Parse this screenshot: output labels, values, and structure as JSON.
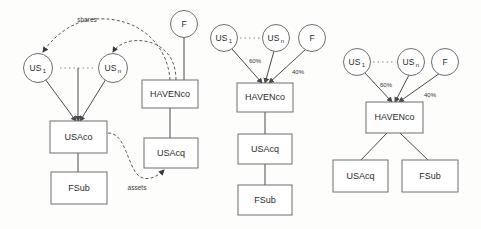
{
  "diagram": {
    "background_color": "#fdfdfc",
    "line_color": "#4a4a4a",
    "box_fill": "#ffffff",
    "panels": [
      {
        "id": "panel-left",
        "name": "step-one-share-and-asset-transfer",
        "nodes": {
          "us1": "US",
          "us1_sub": "1",
          "usn": "US",
          "usn_sub": "n",
          "f": "F",
          "usaco": "USAco",
          "fsub": "FSub",
          "havenco": "HAVENco",
          "usacq": "USAcq"
        },
        "annotations": {
          "shares": "shares",
          "assets": "assets"
        }
      },
      {
        "id": "panel-middle",
        "name": "step-two-havenco-holding-chain",
        "nodes": {
          "us1": "US",
          "us1_sub": "1",
          "usn": "US",
          "usn_sub": "n",
          "f": "F",
          "havenco": "HAVENco",
          "usacq": "USAcq",
          "fsub": "FSub"
        },
        "annotations": {
          "pct_us": "60%",
          "pct_f": "40%"
        }
      },
      {
        "id": "panel-right",
        "name": "step-three-final-parallel-structure",
        "nodes": {
          "us1": "US",
          "us1_sub": "1",
          "usn": "US",
          "usn_sub": "n",
          "f": "F",
          "havenco": "HAVENco",
          "usacq": "USAcq",
          "fsub": "FSub"
        },
        "annotations": {
          "pct_us": "60%",
          "pct_f": "40%"
        }
      }
    ]
  }
}
